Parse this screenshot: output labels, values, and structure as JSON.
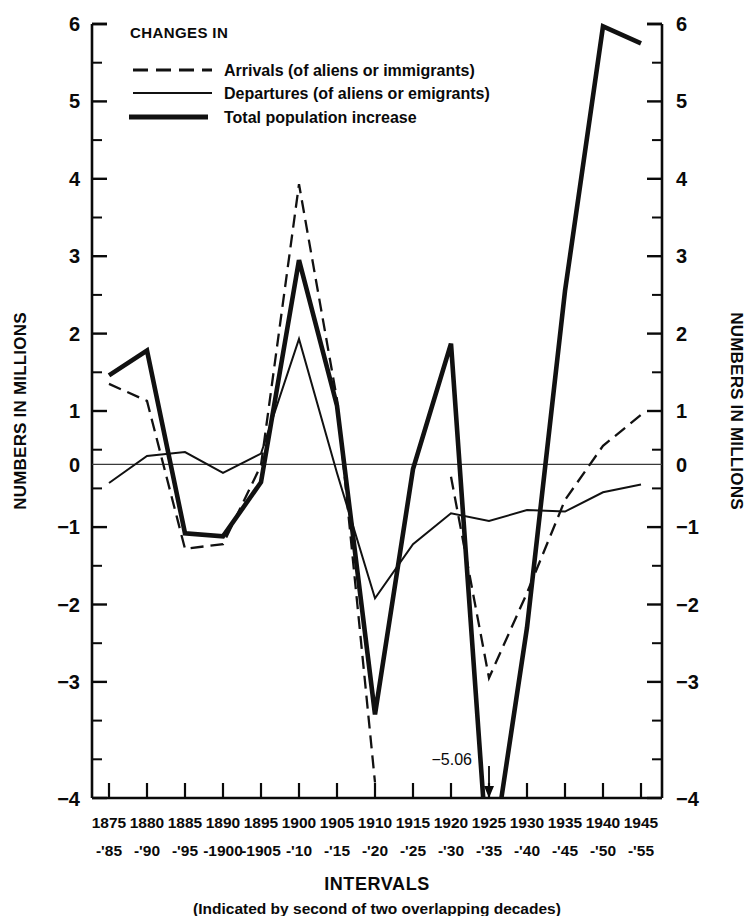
{
  "chart_data": {
    "type": "line",
    "title": "CHANGES IN",
    "xlabel": "INTERVALS",
    "xlabel_sub": "(Indicated by second of two overlapping decades)",
    "ylabel": "NUMBERS IN MILLIONS",
    "ylabel_right": "NUMBERS IN MILLIONS",
    "ylim": [
      -4,
      6
    ],
    "ytick_labels": [
      "6",
      "5",
      "4",
      "3",
      "2",
      "1",
      "0",
      "−1",
      "−2",
      "−3",
      "−4"
    ],
    "ytick_values": [
      6,
      5,
      4,
      3,
      2,
      1,
      0,
      -1,
      -2,
      -3,
      -4
    ],
    "minor_tick_step": 0.5,
    "grid": false,
    "legend_position": "top-left-inside",
    "categories": [
      "1875-'85",
      "1880-'90",
      "1885-'95",
      "1890-1900",
      "1895-1905",
      "1900-'10",
      "1905-'15",
      "1910-'20",
      "1915-'25",
      "1920-'30",
      "1925-'35",
      "1930-'40",
      "1935-'45",
      "1940-'50",
      "1945-'55"
    ],
    "xtick_top": [
      "1875",
      "1880",
      "1885",
      "1890",
      "1895",
      "1900",
      "1905",
      "1910",
      "1915",
      "1920",
      "1925",
      "1930",
      "1935",
      "1940",
      "1945"
    ],
    "xtick_bottom": [
      "-'85",
      "-'90",
      "-'95",
      "-1900",
      "-1905",
      "-'10",
      "-'15",
      "-'20",
      "-'25",
      "-'30",
      "-'35",
      "-'40",
      "-'45",
      "-'50",
      "-'55"
    ],
    "series": [
      {
        "name": "Arrivals (of aliens or immigrants)",
        "style": "dashed",
        "values": [
          1.35,
          1.13,
          -0.78,
          -0.72,
          0.3,
          3.93,
          1.15,
          -3.8,
          null,
          0.15,
          -2.45,
          -1.35,
          -0.15,
          0.55,
          0.95
        ]
      },
      {
        "name": "Departures (of aliens or emigrants)",
        "style": "solid",
        "values": [
          0.07,
          0.42,
          0.47,
          0.2,
          0.45,
          1.93,
          0.2,
          -1.42,
          -0.72,
          -0.32,
          -0.42,
          -0.28,
          -0.3,
          -0.05,
          0.05
        ]
      },
      {
        "name": "Total population increase",
        "style": "thick",
        "values": [
          1.46,
          1.78,
          -0.58,
          -0.62,
          0.08,
          2.95,
          1.07,
          -2.92,
          0.25,
          1.87,
          -5.06,
          -1.8,
          2.55,
          5.97,
          5.75
        ]
      }
    ],
    "annotations": [
      {
        "text": "−5.06",
        "target_category": "1925-'35",
        "value": -5.06,
        "marker": "down-arrow"
      }
    ],
    "legend_entries": [
      {
        "label": "Arrivals (of aliens or immigrants)",
        "style": "dashed"
      },
      {
        "label": "Departures (of aliens or emigrants)",
        "style": "solid"
      },
      {
        "label": "Total population increase",
        "style": "thick"
      }
    ]
  },
  "colors": {
    "ink": "#0a0a0a",
    "background": "#ffffff",
    "zero_line": "#3a3a3a"
  }
}
